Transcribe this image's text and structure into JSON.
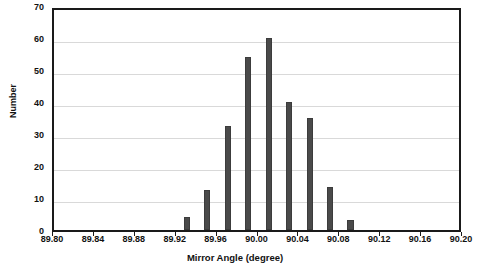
{
  "chart_data": {
    "type": "bar",
    "title": "",
    "subtitle": "",
    "xlabel": "Mirror Angle (degree)",
    "ylabel": "Number",
    "xlim": [
      89.8,
      90.2
    ],
    "ylim": [
      0,
      70
    ],
    "grid": true,
    "legend": null,
    "bar_color": "#4a4a4a",
    "bar_width": 0.006,
    "xticks": [
      "89.80",
      "89.84",
      "89.88",
      "89.92",
      "89.96",
      "90.00",
      "90.04",
      "90.08",
      "90.12",
      "90.16",
      "90.20"
    ],
    "xtick_values": [
      89.8,
      89.84,
      89.88,
      89.92,
      89.96,
      90.0,
      90.04,
      90.08,
      90.12,
      90.16,
      90.2
    ],
    "yticks": [
      "0",
      "10",
      "20",
      "30",
      "40",
      "50",
      "60",
      "70"
    ],
    "ytick_values": [
      0,
      10,
      20,
      30,
      40,
      50,
      60,
      70
    ],
    "categories": [
      "89.93",
      "89.95",
      "89.97",
      "89.99",
      "90.01",
      "90.03",
      "90.05",
      "90.07",
      "90.09"
    ],
    "x": [
      89.93,
      89.95,
      89.97,
      89.99,
      90.01,
      90.03,
      90.05,
      90.07,
      90.09
    ],
    "values": [
      4,
      12.5,
      32.5,
      54,
      60,
      40,
      35,
      13.5,
      3
    ]
  },
  "axes": {
    "y_title": "Number",
    "x_title": "Mirror Angle (degree)"
  }
}
